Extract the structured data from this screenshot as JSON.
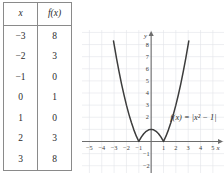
{
  "table": {
    "headers": [
      "x",
      "f(x)"
    ],
    "rows": [
      {
        "x": "−3",
        "fx": "8"
      },
      {
        "x": "−2",
        "fx": "3"
      },
      {
        "x": "−1",
        "fx": "0"
      },
      {
        "x": "0",
        "fx": "1"
      },
      {
        "x": "1",
        "fx": "0"
      },
      {
        "x": "2",
        "fx": "3"
      },
      {
        "x": "3",
        "fx": "8"
      }
    ]
  },
  "graph": {
    "equation_label": "f(x) = |x² − 1|",
    "x_axis_name": "x",
    "y_axis_name": "y",
    "x_tick_labels": [
      "−5",
      "−4",
      "−3",
      "−2",
      "−1",
      "1",
      "2",
      "3",
      "4",
      "5"
    ],
    "y_tick_labels": [
      "8",
      "7",
      "6",
      "5",
      "4",
      "3",
      "2",
      "−1",
      "−2"
    ],
    "colors": {
      "curve": "#3c3c3c",
      "axis": "#6d6d6d",
      "grid": "#e2e4ea",
      "text": "#2b2b2b"
    }
  },
  "chart_data": {
    "type": "line",
    "title": "",
    "xlabel": "x",
    "ylabel": "y",
    "xlim": [
      -5.6,
      5.9
    ],
    "ylim": [
      -2.6,
      9.2
    ],
    "grid": true,
    "legend": "none",
    "annotations": [
      "f(x) = |x² − 1|"
    ],
    "xticks": [
      -5,
      -4,
      -3,
      -2,
      -1,
      1,
      2,
      3,
      4,
      5
    ],
    "yticks": [
      8,
      7,
      6,
      5,
      4,
      3,
      2,
      -1,
      -2
    ],
    "series": [
      {
        "name": "f(x) = |x^2 - 1|",
        "x": [
          -3.05,
          -2.8,
          -2.6,
          -2.4,
          -2.2,
          -2.0,
          -1.8,
          -1.6,
          -1.4,
          -1.2,
          -1.0,
          -0.8,
          -0.6,
          -0.4,
          -0.2,
          0.0,
          0.2,
          0.4,
          0.6,
          0.8,
          1.0,
          1.2,
          1.4,
          1.6,
          1.8,
          2.0,
          2.2,
          2.4,
          2.6,
          2.8,
          3.05
        ],
        "y": [
          8.3,
          6.84,
          5.76,
          4.76,
          3.84,
          3.0,
          2.24,
          1.56,
          0.96,
          0.44,
          0.0,
          0.36,
          0.64,
          0.84,
          0.96,
          1.0,
          0.96,
          0.84,
          0.64,
          0.36,
          0.0,
          0.44,
          0.96,
          1.56,
          2.24,
          3.0,
          3.84,
          4.76,
          5.76,
          6.84,
          8.3
        ]
      }
    ],
    "table_points": {
      "x": [
        -3,
        -2,
        -1,
        0,
        1,
        2,
        3
      ],
      "fx": [
        8,
        3,
        0,
        1,
        0,
        3,
        8
      ]
    }
  }
}
